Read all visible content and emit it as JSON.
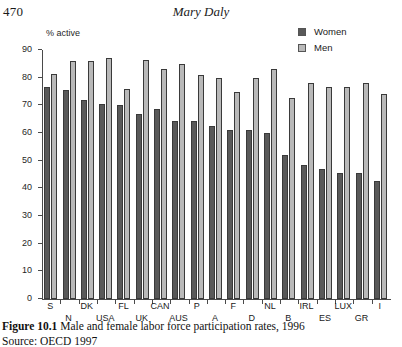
{
  "page": {
    "folio": "470",
    "running_head": "Mary Daly"
  },
  "legend": {
    "items": [
      {
        "label": "Women",
        "color": "#595959",
        "key": "women"
      },
      {
        "label": "Men",
        "color": "#b9b9b9",
        "key": "men"
      }
    ]
  },
  "caption": {
    "figure_number": "Figure 10.1",
    "text": "Male and female labor force participation rates, 1996",
    "source": "Source: OECD 1997"
  },
  "chart_data": {
    "type": "bar",
    "title": "Male and female labor force participation rates, 1996",
    "xlabel": "",
    "ylabel": "% active",
    "ylim": [
      0,
      90
    ],
    "yticks": [
      0,
      10,
      20,
      30,
      40,
      50,
      60,
      70,
      80,
      90
    ],
    "grid": false,
    "legend_position": "top-right",
    "categories": [
      "S",
      "N",
      "DK",
      "USA",
      "FL",
      "UK",
      "CAN",
      "AUS",
      "P",
      "A",
      "F",
      "D",
      "NL",
      "B",
      "IRL",
      "ES",
      "LUX",
      "GR",
      "I"
    ],
    "series": [
      {
        "name": "Women",
        "color": "#595959",
        "values": [
          76.5,
          75.5,
          72,
          70.5,
          70,
          67,
          68.5,
          64.5,
          64.5,
          62.5,
          61,
          61,
          60,
          52,
          48.5,
          47,
          45.5,
          45.5,
          42.5
        ]
      },
      {
        "name": "Men",
        "color": "#b9b9b9",
        "values": [
          81.5,
          86,
          86,
          87,
          76,
          86.5,
          83,
          85,
          81,
          80,
          75,
          80,
          83,
          72.5,
          78,
          76.5,
          76.5,
          78,
          74
        ]
      }
    ]
  }
}
